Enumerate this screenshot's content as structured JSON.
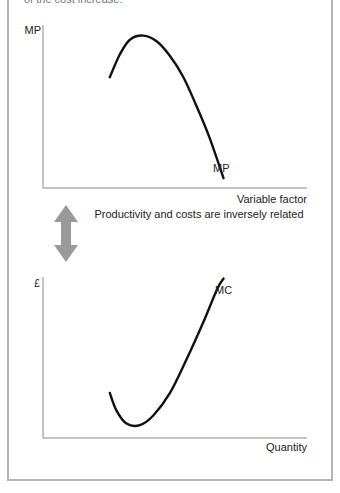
{
  "header": {
    "clipped_text": "of the cost increase."
  },
  "diagram": {
    "relationship_caption": "Productivity and costs are inversely related",
    "arrow_color": "#9a9a9a",
    "curve_color": "#111111",
    "axis_color": "#8a8a8a"
  },
  "chart_data": [
    {
      "type": "line",
      "title": "",
      "ylabel": "MP",
      "xlabel": "Variable factor",
      "curve_label": "MP",
      "description": "Marginal product rises, peaks, then falls",
      "series": [
        {
          "name": "MP",
          "points": [
            [
              2.0,
              6.8
            ],
            [
              2.3,
              8.2
            ],
            [
              2.6,
              9.1
            ],
            [
              3.0,
              9.35
            ],
            [
              3.4,
              9.0
            ],
            [
              3.8,
              8.1
            ],
            [
              4.2,
              6.8
            ],
            [
              4.6,
              5.0
            ],
            [
              5.0,
              3.0
            ],
            [
              5.4,
              0.6
            ]
          ]
        }
      ],
      "xlim": [
        0,
        7.9
      ],
      "ylim": [
        0,
        10
      ],
      "grid": false
    },
    {
      "type": "line",
      "title": "",
      "ylabel": "£",
      "xlabel": "Quantity",
      "curve_label": "MC",
      "description": "Marginal cost falls, reaches a minimum, then rises",
      "series": [
        {
          "name": "MC",
          "points": [
            [
              2.0,
              2.8
            ],
            [
              2.2,
              1.7
            ],
            [
              2.5,
              0.9
            ],
            [
              2.9,
              0.8
            ],
            [
              3.3,
              1.4
            ],
            [
              3.8,
              2.8
            ],
            [
              4.3,
              4.9
            ],
            [
              4.8,
              7.2
            ],
            [
              5.2,
              9.2
            ],
            [
              5.4,
              9.9
            ]
          ]
        }
      ],
      "xlim": [
        0,
        7.9
      ],
      "ylim": [
        0,
        10
      ],
      "grid": false
    }
  ]
}
